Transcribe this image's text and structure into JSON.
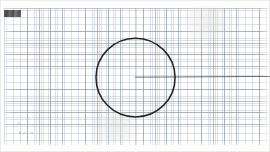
{
  "document": {
    "kind": "graph-paper-scan",
    "paper_color": "#fbfbfa",
    "page_width": 270,
    "page_height": 152
  },
  "grid": {
    "minor_spacing_px": 2.32,
    "major_spacing_px": 11.6,
    "minor_color": "#78869 6",
    "minor_color_hex": "#788696",
    "major_color_hex": "#5c6a7c",
    "origin_x": 4,
    "origin_y": 8,
    "width": 264,
    "height": 137
  },
  "annotations": {
    "corner_stamp": {
      "label": "",
      "description": "smudged-dark-stamp",
      "x": 4,
      "y": 10,
      "width": 17,
      "height": 7,
      "color": "#3a3a3a"
    },
    "pencil_marks": [
      {
        "text": "A",
        "x": 17,
        "y": 121
      },
      {
        "text": "h o . n",
        "x": 19,
        "y": 130
      }
    ]
  },
  "drawing": {
    "ink_color": "#1c1c1c",
    "circle": {
      "label": "hand-drawn-circle",
      "center_x": 135.5,
      "center_y": 77.5,
      "radius": 39.5,
      "stroke_width": 1.5,
      "stroke_color": "#1a1a1a"
    },
    "radius_line": {
      "label": "horizontal-radius-line",
      "x1": 135.5,
      "y1": 77.2,
      "x2": 270,
      "y2": 76.4,
      "stroke_width": 0.75,
      "stroke_color": "#3c3c42"
    },
    "vertical_construction_line": {
      "label": "vertical-construction-line",
      "x": 135.4,
      "y1": 8,
      "y2": 145,
      "stroke_width": 0.6,
      "stroke_color": "#6e7480"
    }
  }
}
